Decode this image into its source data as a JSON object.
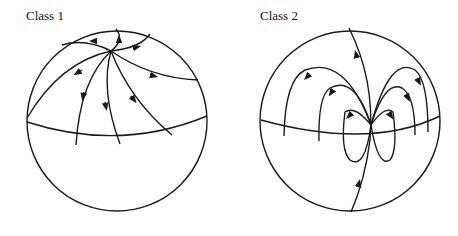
{
  "panels": [
    {
      "title": "Class 1",
      "description": "Sphere with a single node near the top; trajectories radiate out toward the equator and boundary."
    },
    {
      "title": "Class 2",
      "description": "Sphere with a dipole-like node near the equator; loop trajectories and a meridian flow line."
    }
  ],
  "colors": {
    "stroke": "#1a1a1a",
    "background": "#ffffff"
  }
}
